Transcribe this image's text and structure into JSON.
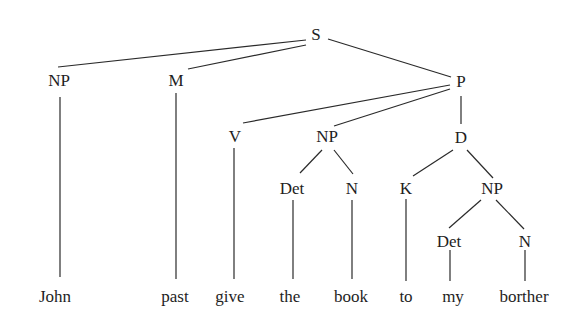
{
  "diagram": {
    "type": "syntax-tree",
    "line_color": "#2a2a2a",
    "text_color": "#1e1e1e",
    "nodes": [
      {
        "id": "S",
        "label": "S",
        "x": 316,
        "y": 34
      },
      {
        "id": "NP1",
        "label": "NP",
        "x": 59,
        "y": 80
      },
      {
        "id": "M",
        "label": "M",
        "x": 176,
        "y": 80
      },
      {
        "id": "P",
        "label": "P",
        "x": 461,
        "y": 81
      },
      {
        "id": "V",
        "label": "V",
        "x": 235,
        "y": 136
      },
      {
        "id": "NP2",
        "label": "NP",
        "x": 327,
        "y": 136
      },
      {
        "id": "D",
        "label": "D",
        "x": 461,
        "y": 137
      },
      {
        "id": "Det1",
        "label": "Det",
        "x": 292,
        "y": 188
      },
      {
        "id": "N1",
        "label": "N",
        "x": 352,
        "y": 188
      },
      {
        "id": "K",
        "label": "K",
        "x": 406,
        "y": 188
      },
      {
        "id": "NP3",
        "label": "NP",
        "x": 492,
        "y": 188
      },
      {
        "id": "Det2",
        "label": "Det",
        "x": 449,
        "y": 241
      },
      {
        "id": "N2",
        "label": "N",
        "x": 525,
        "y": 241
      }
    ],
    "leaves": [
      {
        "id": "w1",
        "label": "John",
        "x": 55,
        "y": 296
      },
      {
        "id": "w2",
        "label": "past",
        "x": 175,
        "y": 296
      },
      {
        "id": "w3",
        "label": "give",
        "x": 230,
        "y": 296
      },
      {
        "id": "w4",
        "label": "the",
        "x": 290,
        "y": 296
      },
      {
        "id": "w5",
        "label": "book",
        "x": 351,
        "y": 296
      },
      {
        "id": "w6",
        "label": "to",
        "x": 406,
        "y": 296
      },
      {
        "id": "w7",
        "label": "my",
        "x": 453,
        "y": 296
      },
      {
        "id": "w8",
        "label": "borther",
        "x": 524,
        "y": 296
      }
    ],
    "edges": [
      {
        "from": "S",
        "to": "NP1",
        "x1": 306,
        "y1": 40,
        "x2": 58,
        "y2": 67
      },
      {
        "from": "S",
        "to": "M",
        "x1": 306,
        "y1": 45,
        "x2": 188,
        "y2": 69
      },
      {
        "from": "S",
        "to": "P",
        "x1": 328,
        "y1": 39,
        "x2": 451,
        "y2": 77
      },
      {
        "from": "P",
        "to": "V",
        "x1": 450,
        "y1": 85,
        "x2": 243,
        "y2": 123
      },
      {
        "from": "P",
        "to": "NP2",
        "x1": 450,
        "y1": 89,
        "x2": 334,
        "y2": 126
      },
      {
        "from": "P",
        "to": "D",
        "x1": 461,
        "y1": 96,
        "x2": 461,
        "y2": 124
      },
      {
        "from": "NP2",
        "to": "Det1",
        "x1": 322,
        "y1": 150,
        "x2": 300,
        "y2": 173
      },
      {
        "from": "NP2",
        "to": "N1",
        "x1": 334,
        "y1": 150,
        "x2": 353,
        "y2": 174
      },
      {
        "from": "D",
        "to": "K",
        "x1": 453,
        "y1": 150,
        "x2": 413,
        "y2": 176
      },
      {
        "from": "D",
        "to": "NP3",
        "x1": 467,
        "y1": 150,
        "x2": 493,
        "y2": 178
      },
      {
        "from": "NP3",
        "to": "Det2",
        "x1": 481,
        "y1": 200,
        "x2": 449,
        "y2": 228
      },
      {
        "from": "NP3",
        "to": "N2",
        "x1": 496,
        "y1": 200,
        "x2": 524,
        "y2": 229
      },
      {
        "from": "NP1",
        "to": "w1",
        "x1": 60,
        "y1": 97,
        "x2": 60,
        "y2": 277
      },
      {
        "from": "M",
        "to": "w2",
        "x1": 176,
        "y1": 93,
        "x2": 176,
        "y2": 279
      },
      {
        "from": "V",
        "to": "w3",
        "x1": 234,
        "y1": 148,
        "x2": 234,
        "y2": 279
      },
      {
        "from": "Det1",
        "to": "w4",
        "x1": 293,
        "y1": 200,
        "x2": 293,
        "y2": 279
      },
      {
        "from": "N1",
        "to": "w5",
        "x1": 352,
        "y1": 200,
        "x2": 352,
        "y2": 279
      },
      {
        "from": "K",
        "to": "w6",
        "x1": 406,
        "y1": 199,
        "x2": 406,
        "y2": 281
      },
      {
        "from": "Det2",
        "to": "w7",
        "x1": 450,
        "y1": 250,
        "x2": 450,
        "y2": 281
      },
      {
        "from": "N2",
        "to": "w8",
        "x1": 525,
        "y1": 250,
        "x2": 525,
        "y2": 281
      }
    ]
  }
}
